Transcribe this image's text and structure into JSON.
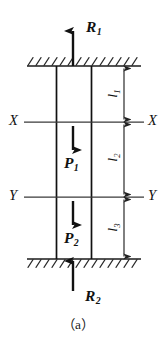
{
  "figure": {
    "caption": "（a）"
  },
  "colors": {
    "ink": "#111111",
    "line": "#333333",
    "hatch": "#2b2b2b",
    "background": "#ffffff"
  },
  "forces": [
    {
      "id": "R1",
      "base": "R",
      "sub": "1",
      "direction": "up",
      "location": "above-top-support"
    },
    {
      "id": "P1",
      "base": "P",
      "sub": "1",
      "direction": "down",
      "location": "upper-bar-segment"
    },
    {
      "id": "P2",
      "base": "P",
      "sub": "2",
      "direction": "down",
      "location": "lower-bar-segment"
    },
    {
      "id": "R2",
      "base": "R",
      "sub": "2",
      "direction": "up",
      "location": "below-bottom-support"
    }
  ],
  "section_lines": [
    {
      "id": "XX",
      "label_left": "X",
      "label_right": "X"
    },
    {
      "id": "YY",
      "label_left": "Y",
      "label_right": "Y"
    }
  ],
  "dimensions": [
    {
      "id": "l1",
      "base": "l",
      "sub": "1",
      "span": "top-support-to-XX"
    },
    {
      "id": "l2",
      "base": "l",
      "sub": "2",
      "span": "XX-to-YY"
    },
    {
      "id": "l3",
      "base": "l",
      "sub": "3",
      "span": "YY-to-bottom-support"
    }
  ],
  "supports": [
    {
      "id": "top-support",
      "hatching": "above"
    },
    {
      "id": "bottom-support",
      "hatching": "below"
    }
  ]
}
